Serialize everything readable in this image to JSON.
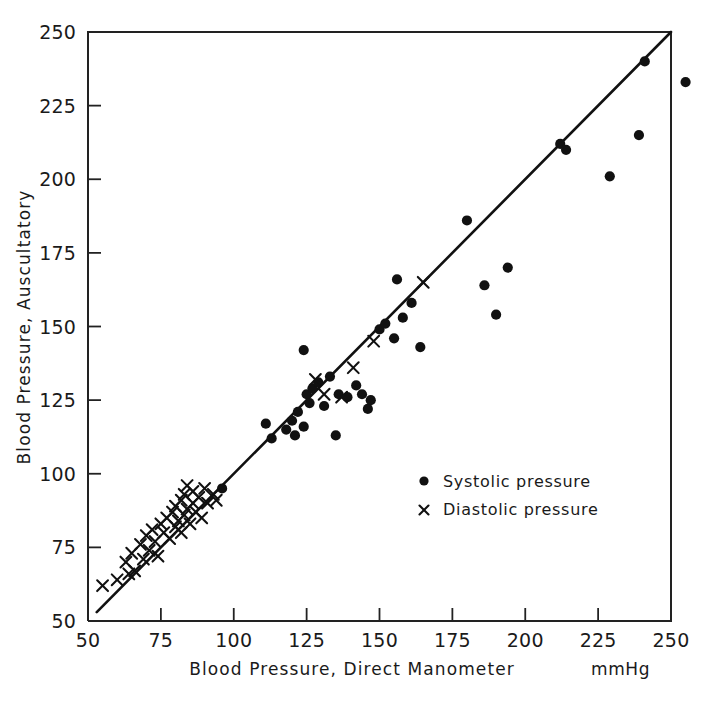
{
  "chart_data": {
    "type": "scatter",
    "title": "",
    "xlabel": "Blood Pressure, Direct Manometer",
    "ylabel": "Blood Pressure, Auscultatory",
    "units": "mmHg",
    "xlim": [
      50,
      250
    ],
    "ylim": [
      50,
      250
    ],
    "xticks": [
      50,
      75,
      100,
      125,
      150,
      175,
      200,
      225,
      250
    ],
    "yticks": [
      50,
      75,
      100,
      125,
      150,
      175,
      200,
      225,
      250
    ],
    "xtick_labels": [
      "50",
      "75",
      "100",
      "125",
      "150",
      "175",
      "200",
      "225",
      "250"
    ],
    "ytick_labels": [
      "50",
      "75",
      "100",
      "125",
      "150",
      "175",
      "200",
      "225",
      "250"
    ],
    "grid": false,
    "legend_position": "center-right",
    "reference_line": {
      "label": "line of identity",
      "from": [
        53,
        53
      ],
      "to": [
        250,
        250
      ]
    },
    "series": [
      {
        "name": "Systolic pressure",
        "marker": "filled-circle",
        "color": "#111111",
        "points": [
          [
            96,
            95
          ],
          [
            111,
            117
          ],
          [
            113,
            112
          ],
          [
            118,
            115
          ],
          [
            120,
            118
          ],
          [
            121,
            113
          ],
          [
            122,
            121
          ],
          [
            124,
            116
          ],
          [
            124,
            142
          ],
          [
            125,
            127
          ],
          [
            126,
            124
          ],
          [
            127,
            129
          ],
          [
            129,
            131
          ],
          [
            131,
            123
          ],
          [
            133,
            133
          ],
          [
            135,
            113
          ],
          [
            136,
            127
          ],
          [
            139,
            126
          ],
          [
            142,
            130
          ],
          [
            144,
            127
          ],
          [
            146,
            122
          ],
          [
            147,
            125
          ],
          [
            150,
            149
          ],
          [
            152,
            151
          ],
          [
            155,
            146
          ],
          [
            156,
            166
          ],
          [
            158,
            153
          ],
          [
            161,
            158
          ],
          [
            164,
            143
          ],
          [
            180,
            186
          ],
          [
            186,
            164
          ],
          [
            190,
            154
          ],
          [
            194,
            170
          ],
          [
            212,
            212
          ],
          [
            214,
            210
          ],
          [
            229,
            201
          ],
          [
            239,
            215
          ],
          [
            241,
            240
          ],
          [
            255,
            233
          ]
        ]
      },
      {
        "name": "Diastolic pressure",
        "marker": "cross",
        "color": "#111111",
        "points": [
          [
            55,
            62
          ],
          [
            60,
            64
          ],
          [
            63,
            70
          ],
          [
            64,
            66
          ],
          [
            65,
            73
          ],
          [
            66,
            67
          ],
          [
            68,
            76
          ],
          [
            69,
            71
          ],
          [
            70,
            79
          ],
          [
            71,
            74
          ],
          [
            72,
            81
          ],
          [
            73,
            77
          ],
          [
            74,
            72
          ],
          [
            75,
            83
          ],
          [
            76,
            80
          ],
          [
            77,
            85
          ],
          [
            78,
            78
          ],
          [
            79,
            87
          ],
          [
            80,
            82
          ],
          [
            80,
            89
          ],
          [
            81,
            84
          ],
          [
            82,
            91
          ],
          [
            82,
            80
          ],
          [
            83,
            86
          ],
          [
            83,
            93
          ],
          [
            84,
            88
          ],
          [
            84,
            96
          ],
          [
            85,
            83
          ],
          [
            86,
            90
          ],
          [
            86,
            94
          ],
          [
            87,
            87
          ],
          [
            88,
            92
          ],
          [
            89,
            85
          ],
          [
            90,
            95
          ],
          [
            91,
            90
          ],
          [
            93,
            93
          ],
          [
            94,
            91
          ],
          [
            128,
            132
          ],
          [
            131,
            127
          ],
          [
            137,
            126
          ],
          [
            141,
            136
          ],
          [
            148,
            145
          ],
          [
            165,
            165
          ]
        ]
      }
    ]
  },
  "legend": {
    "systolic_label": "Systolic pressure",
    "diastolic_label": "Diastolic pressure",
    "systolic_marker": "dot-marker-icon",
    "diastolic_marker": "cross-marker-icon"
  },
  "axes": {
    "x_title": "Blood Pressure, Direct Manometer",
    "y_title": "Blood Pressure, Auscultatory",
    "unit": "mmHg"
  }
}
